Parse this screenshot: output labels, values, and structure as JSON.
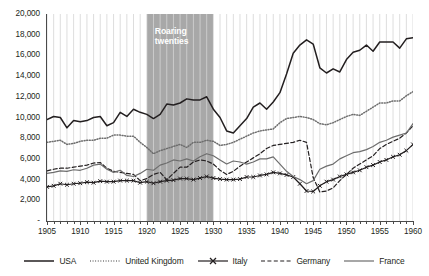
{
  "chart_data": {
    "type": "line",
    "title": "",
    "xlabel": "",
    "ylabel": "",
    "xlim": [
      1905,
      1960
    ],
    "ylim": [
      0,
      20000
    ],
    "grid": "vertical",
    "legend_position": "bottom",
    "y_ticks": [
      "-",
      "2,000",
      "4,000",
      "6,000",
      "8,000",
      "10,000",
      "12,000",
      "14,000",
      "16,000",
      "18,000",
      "20,000"
    ],
    "y_tick_values": [
      0,
      2000,
      4000,
      6000,
      8000,
      10000,
      12000,
      14000,
      16000,
      18000,
      20000
    ],
    "x_ticks": [
      "1905",
      "1910",
      "1915",
      "1920",
      "1925",
      "1930",
      "1935",
      "1940",
      "1945",
      "1950",
      "1955",
      "1960"
    ],
    "x_tick_values": [
      1905,
      1910,
      1915,
      1920,
      1925,
      1930,
      1935,
      1940,
      1945,
      1950,
      1955,
      1960
    ],
    "annotations": [
      {
        "name": "roaring-twenties-band",
        "label": "Roaring twenties",
        "label_lines": [
          "Roaring",
          "twenties"
        ],
        "x_start": 1920,
        "x_end": 1930,
        "color": "#a8a8a8",
        "text_color": "#ffffff"
      }
    ],
    "x": [
      1905,
      1906,
      1907,
      1908,
      1909,
      1910,
      1911,
      1912,
      1913,
      1914,
      1915,
      1916,
      1917,
      1918,
      1919,
      1920,
      1921,
      1922,
      1923,
      1924,
      1925,
      1926,
      1927,
      1928,
      1929,
      1930,
      1931,
      1932,
      1933,
      1934,
      1935,
      1936,
      1937,
      1938,
      1939,
      1940,
      1941,
      1942,
      1943,
      1944,
      1945,
      1946,
      1947,
      1948,
      1949,
      1950,
      1951,
      1952,
      1953,
      1954,
      1955,
      1956,
      1957,
      1958,
      1959,
      1960
    ],
    "series": [
      {
        "name": "USA",
        "color": "#231f20",
        "style": "solid",
        "marker": "none",
        "values": [
          9800,
          10100,
          10000,
          9000,
          9700,
          9600,
          9700,
          10000,
          10100,
          9200,
          9500,
          10500,
          10100,
          10800,
          10500,
          10300,
          9900,
          10300,
          11300,
          11200,
          11400,
          11800,
          11700,
          11700,
          12000,
          10800,
          10000,
          8700,
          8500,
          9200,
          9900,
          11000,
          11400,
          10800,
          11500,
          12400,
          14200,
          16200,
          17000,
          17500,
          17100,
          14800,
          14300,
          14700,
          14400,
          15600,
          16300,
          16500,
          17000,
          16400,
          17300,
          17300,
          17300,
          16700,
          17600,
          17700
        ]
      },
      {
        "name": "United Kingdom",
        "color": "#6d6d6d",
        "style": "dotted",
        "marker": "none",
        "values": [
          7600,
          7700,
          7800,
          7400,
          7500,
          7700,
          7800,
          7800,
          8000,
          8000,
          8300,
          8300,
          8200,
          8200,
          7600,
          7100,
          6500,
          6800,
          7000,
          7200,
          7400,
          7100,
          7600,
          7600,
          7800,
          7700,
          7300,
          7400,
          7600,
          7900,
          8200,
          8500,
          8700,
          8800,
          8900,
          9500,
          9900,
          10000,
          10100,
          10000,
          9800,
          9400,
          9300,
          9500,
          9800,
          10100,
          10300,
          10200,
          10600,
          11000,
          11400,
          11400,
          11600,
          11600,
          12100,
          12500
        ]
      },
      {
        "name": "Italy",
        "color": "#231f20",
        "style": "solid",
        "marker": "x",
        "values": [
          3300,
          3400,
          3600,
          3500,
          3600,
          3650,
          3750,
          3700,
          3850,
          3800,
          3800,
          3900,
          3900,
          3900,
          3700,
          3800,
          3650,
          3800,
          3900,
          3950,
          4100,
          4100,
          4000,
          4150,
          4300,
          4150,
          4050,
          4000,
          4000,
          4050,
          4250,
          4250,
          4400,
          4500,
          4700,
          4600,
          4450,
          4250,
          3600,
          2900,
          2850,
          3400,
          3800,
          4000,
          4300,
          4500,
          4700,
          4900,
          5200,
          5400,
          5700,
          5900,
          6200,
          6400,
          6800,
          7400
        ]
      },
      {
        "name": "Germany",
        "color": "#231f20",
        "style": "dashed",
        "marker": "none",
        "values": [
          4850,
          5000,
          5100,
          5100,
          5200,
          5300,
          5400,
          5600,
          5650,
          5100,
          4800,
          4700,
          4600,
          4500,
          3900,
          4100,
          4500,
          4700,
          4000,
          4600,
          5200,
          5200,
          5700,
          5900,
          5800,
          5500,
          4900,
          4500,
          4800,
          5300,
          5700,
          6100,
          6500,
          7000,
          7300,
          7400,
          7500,
          7600,
          7800,
          7600,
          4200,
          2800,
          2900,
          3200,
          3900,
          4500,
          5100,
          5500,
          5900,
          6300,
          7000,
          7400,
          7700,
          8000,
          8500,
          9200
        ]
      },
      {
        "name": "France",
        "color": "#6d6d6d",
        "style": "solid",
        "marker": "none",
        "values": [
          4600,
          4700,
          4850,
          4800,
          4950,
          4900,
          5100,
          5400,
          5500,
          5000,
          4700,
          4900,
          4400,
          4300,
          4600,
          5000,
          4900,
          5400,
          5600,
          5900,
          5800,
          6000,
          5800,
          6200,
          6500,
          6300,
          5900,
          5500,
          5800,
          5700,
          5500,
          5700,
          6000,
          6000,
          6200,
          5500,
          4800,
          4300,
          4000,
          3600,
          3900,
          5000,
          5300,
          5500,
          6000,
          6300,
          6600,
          6700,
          6900,
          7200,
          7600,
          7800,
          8100,
          8300,
          8500,
          9400
        ]
      }
    ]
  },
  "legend": {
    "items": [
      {
        "label": "USA",
        "name": "legend-usa"
      },
      {
        "label": "United Kingdom",
        "name": "legend-united-kingdom"
      },
      {
        "label": "Italy",
        "name": "legend-italy"
      },
      {
        "label": "Germany",
        "name": "legend-germany"
      },
      {
        "label": "France",
        "name": "legend-france"
      }
    ]
  }
}
